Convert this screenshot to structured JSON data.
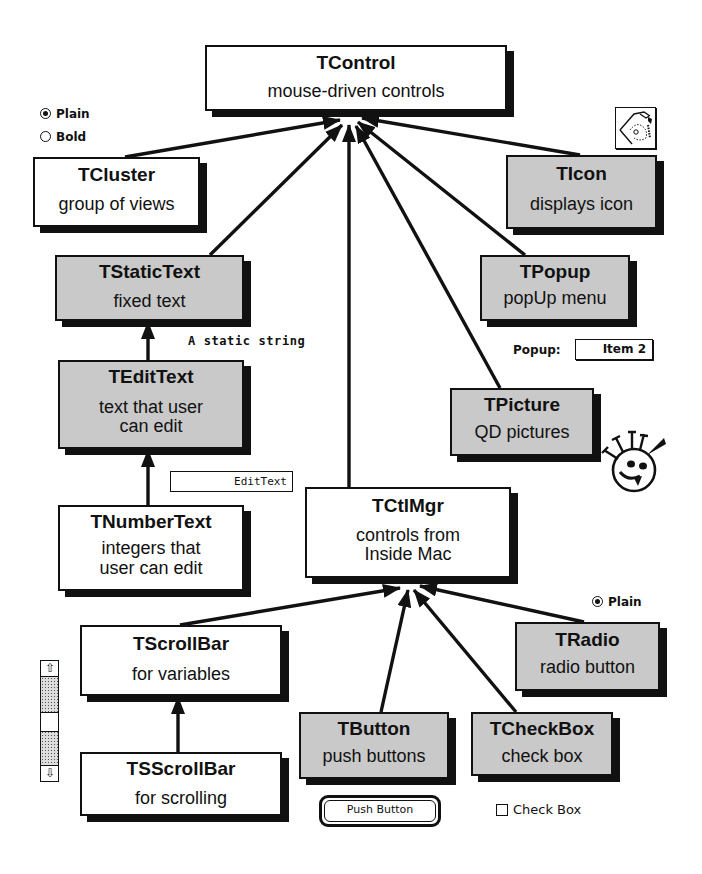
{
  "diagram": {
    "nodes": [
      {
        "id": "tcontrol",
        "title": "TControl",
        "desc": "mouse-driven controls",
        "style": "white"
      },
      {
        "id": "tcluster",
        "title": "TCluster",
        "desc": "group of views",
        "style": "white"
      },
      {
        "id": "ticon",
        "title": "TIcon",
        "desc": "displays icon",
        "style": "gray"
      },
      {
        "id": "tstatictext",
        "title": "TStaticText",
        "desc": "fixed text",
        "style": "gray"
      },
      {
        "id": "tpopup",
        "title": "TPopup",
        "desc": "popUp menu",
        "style": "gray"
      },
      {
        "id": "tedittext",
        "title": "TEditText",
        "desc": "text that user\n  can edit",
        "style": "gray"
      },
      {
        "id": "tpicture",
        "title": "TPicture",
        "desc": "QD pictures",
        "style": "gray"
      },
      {
        "id": "tnumbertext",
        "title": "TNumberText",
        "desc": "integers that\n  user can edit",
        "style": "white"
      },
      {
        "id": "tctlmgr",
        "title": "TCtlMgr",
        "desc": "controls from\n  Inside Mac",
        "style": "white"
      },
      {
        "id": "tscrollbar",
        "title": "TScrollBar",
        "desc": "for variables",
        "style": "white"
      },
      {
        "id": "tradio",
        "title": "TRadio",
        "desc": "radio button",
        "style": "gray"
      },
      {
        "id": "tsscrollbar",
        "title": "TSScrollBar",
        "desc": "for scrolling",
        "style": "white"
      },
      {
        "id": "tbutton",
        "title": "TButton",
        "desc": "push buttons",
        "style": "gray"
      },
      {
        "id": "tcheckbox",
        "title": "TCheckBox",
        "desc": "check box",
        "style": "gray"
      }
    ],
    "edges": [
      {
        "from": "tcluster",
        "to": "tcontrol"
      },
      {
        "from": "tstatictext",
        "to": "tcontrol"
      },
      {
        "from": "tctlmgr",
        "to": "tcontrol"
      },
      {
        "from": "tpicture",
        "to": "tcontrol"
      },
      {
        "from": "tpopup",
        "to": "tcontrol"
      },
      {
        "from": "ticon",
        "to": "tcontrol"
      },
      {
        "from": "tedittext",
        "to": "tstatictext"
      },
      {
        "from": "tnumbertext",
        "to": "tedittext"
      },
      {
        "from": "tscrollbar",
        "to": "tctlmgr"
      },
      {
        "from": "tbutton",
        "to": "tctlmgr"
      },
      {
        "from": "tcheckbox",
        "to": "tctlmgr"
      },
      {
        "from": "tradio",
        "to": "tctlmgr"
      },
      {
        "from": "tsscrollbar",
        "to": "tscrollbar"
      }
    ]
  },
  "samples": {
    "cluster_radios": [
      {
        "label": "Plain",
        "selected": true
      },
      {
        "label": "Bold",
        "selected": false
      }
    ],
    "static_string": "A static string",
    "edit_text_value": "EditText",
    "popup_label": "Popup:",
    "popup_value": "Item 2",
    "radio_sample": {
      "label": "Plain",
      "selected": true
    },
    "push_button_label": "Push Button",
    "check_box_label": "Check Box",
    "icon_sample": "hand-icon",
    "picture_sample": "smiley-face-picture",
    "scrollbar_sample": "vertical-scrollbar"
  }
}
